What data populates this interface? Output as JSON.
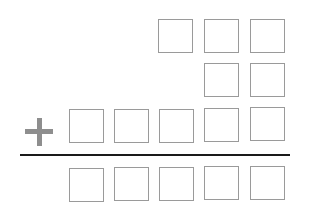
{
  "worksheet": {
    "type": "column-addition",
    "operator": "+",
    "operator_symbol": "plus-sign",
    "rows": [
      {
        "name": "addend-1",
        "digits": 3,
        "values": [
          "",
          "",
          ""
        ]
      },
      {
        "name": "addend-2",
        "digits": 2,
        "values": [
          "",
          ""
        ]
      },
      {
        "name": "addend-3",
        "digits": 5,
        "values": [
          "",
          "",
          "",
          "",
          ""
        ]
      },
      {
        "name": "sum",
        "digits": 5,
        "values": [
          "",
          "",
          "",
          "",
          ""
        ]
      }
    ],
    "colors": {
      "box_border": "#9a9a9a",
      "plus": "#8e8e8e",
      "rule": "#1a1a1a"
    }
  }
}
